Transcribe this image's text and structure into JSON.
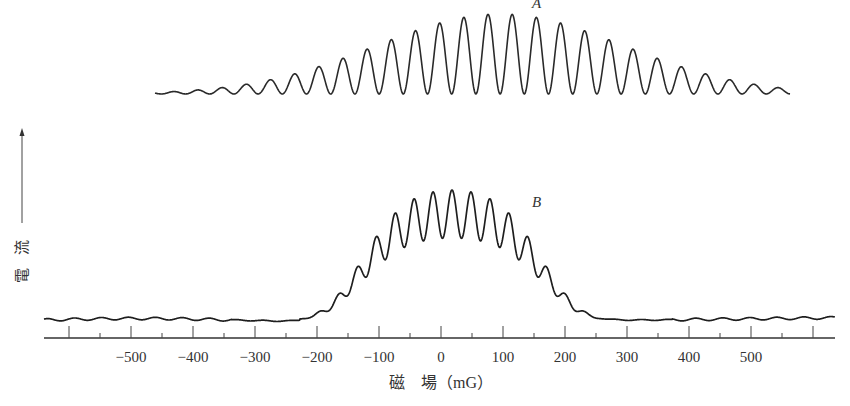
{
  "chart_data": {
    "type": "line",
    "title": "",
    "xlabel": "磁 場 (mG)",
    "ylabel": "電 流",
    "xlim": [
      -650,
      640
    ],
    "grid": false,
    "legend": "none",
    "x_ticks_major": [
      -600,
      -500,
      -400,
      -300,
      -200,
      -100,
      0,
      100,
      200,
      300,
      400,
      500,
      600
    ],
    "x_ticks_labeled": [
      -500,
      -400,
      -300,
      -200,
      -100,
      0,
      100,
      200,
      300,
      400,
      500
    ],
    "x_tick_labels": [
      "−500",
      "−400",
      "−300",
      "−200",
      "−100",
      "0",
      "100",
      "200",
      "300",
      "400",
      "500"
    ],
    "x_ticks_minor": [
      -550,
      -450,
      -350,
      -250,
      -150,
      -50,
      50,
      150,
      250,
      350,
      450,
      550
    ],
    "series": [
      {
        "name": "A",
        "description": "Wide-period interference fringes (large period, ~39 mG) with envelope centered near +95 mG",
        "x_range": [
          -460,
          560
        ],
        "fringe_period_mG": 39,
        "envelope_center_mG": 95,
        "envelope_halfwidth_mG": 380,
        "peak_amplitude_rel": 1.0,
        "fringe_count_visible": 23
      },
      {
        "name": "B",
        "description": "Fine-period interference fringes (~15 mG period) on a Gaussian-like envelope centered near +20 mG",
        "x_range": [
          -650,
          640
        ],
        "fringe_period_mG": 15.3,
        "envelope_center_mG": 20,
        "envelope_halfwidth_mG": 320,
        "peak_amplitude_rel": 1.0,
        "onset_mG": -300,
        "end_mG": 330
      }
    ]
  },
  "figure": {
    "labels": {
      "curve_a": "A",
      "curve_b": "B",
      "x_axis_title": "磁　場（mG）",
      "y_axis_title": "電 流"
    },
    "ink_color": "#2a2a2a",
    "background": "#ffffff"
  },
  "layout": {
    "px_per_100mG": 62,
    "zero_x_px": 441,
    "axis_y_px": 338,
    "axis_x_start_px": 44,
    "axis_x_end_px": 835,
    "curve_a": {
      "baseline_y": 94,
      "x_start_px": 155,
      "x_end_px": 790,
      "peak_top_y": 14,
      "period_px": 24.2,
      "center_px": 500,
      "sigma_px": 175
    },
    "curve_b": {
      "baseline_y": 320,
      "x_start_px": 44,
      "x_end_px": 835,
      "period_px": 9.5,
      "center_px": 452,
      "sigma_px": 95,
      "env_top_y": 190,
      "trough_depth_px": 48
    }
  }
}
